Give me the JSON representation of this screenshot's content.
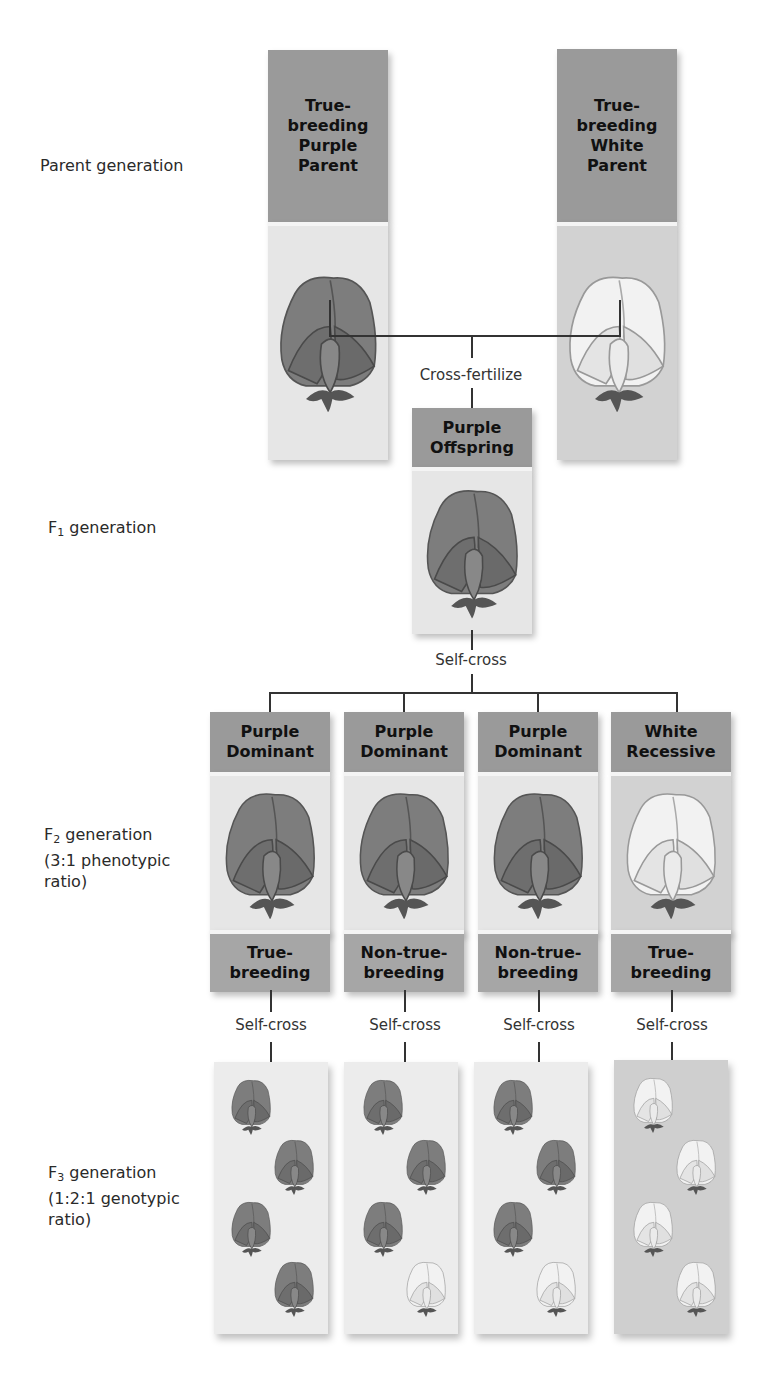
{
  "generations": {
    "parent": {
      "label": "Parent generation"
    },
    "f1": {
      "label_main": "F",
      "label_sub": "1",
      "label_rest": " generation"
    },
    "f2": {
      "label_main": "F",
      "label_sub": "2",
      "label_rest": " generation",
      "line2": "(3:1 phenotypic",
      "line3": "ratio)"
    },
    "f3": {
      "label_main": "F",
      "label_sub": "3",
      "label_rest": " generation",
      "line2": "(1:2:1 genotypic",
      "line3": "ratio)"
    }
  },
  "parents": [
    {
      "title": "True-\nbreeding\nPurple\nParent",
      "color": "purple"
    },
    {
      "title": "True-\nbreeding\nWhite\nParent",
      "color": "white"
    }
  ],
  "cross_fertilize": "Cross-fertilize",
  "f1_box": {
    "title": "Purple\nOffspring",
    "color": "purple"
  },
  "self_cross": "Self-cross",
  "f2_boxes": [
    {
      "title": "Purple\nDominant",
      "footer": "True-\nbreeding",
      "color": "purple",
      "self_cross": "Self-cross"
    },
    {
      "title": "Purple\nDominant",
      "footer": "Non-true-\nbreeding",
      "color": "purple",
      "self_cross": "Self-cross"
    },
    {
      "title": "Purple\nDominant",
      "footer": "Non-true-\nbreeding",
      "color": "purple",
      "self_cross": "Self-cross"
    },
    {
      "title": "White\nRecessive",
      "footer": "True-\nbreeding",
      "color": "white",
      "self_cross": "Self-cross"
    }
  ],
  "f3_panels": [
    {
      "flowers": [
        "purple",
        "purple",
        "purple",
        "purple"
      ]
    },
    {
      "flowers": [
        "purple",
        "purple",
        "purple",
        "white"
      ]
    },
    {
      "flowers": [
        "purple",
        "purple",
        "purple",
        "white"
      ]
    },
    {
      "flowers": [
        "white",
        "white",
        "white",
        "white"
      ]
    }
  ],
  "colors": {
    "header_gray": "#9a9a9a",
    "footer_gray": "#a6a6a6",
    "panel_light": "#ececec",
    "panel_dark": "#cfcfcf"
  }
}
